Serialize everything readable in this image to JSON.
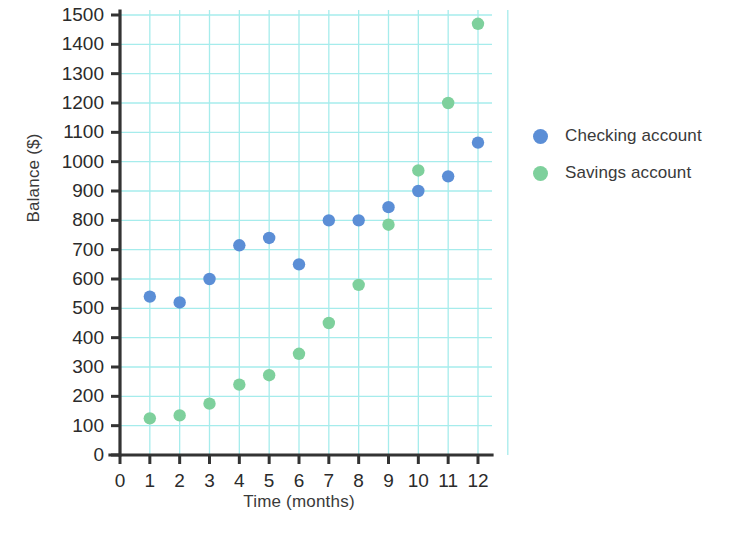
{
  "chart_data": {
    "type": "scatter",
    "title": "",
    "xlabel": "Time (months)",
    "ylabel": "Balance ($)",
    "xlim": [
      0,
      12
    ],
    "ylim": [
      0,
      1500
    ],
    "xticks": [
      0,
      1,
      2,
      3,
      4,
      5,
      6,
      7,
      8,
      9,
      10,
      11,
      12
    ],
    "yticks": [
      0,
      100,
      200,
      300,
      400,
      500,
      600,
      700,
      800,
      900,
      1000,
      1100,
      1200,
      1300,
      1400,
      1500
    ],
    "xtick_labels": [
      "0",
      "1",
      "2",
      "3",
      "4",
      "5",
      "6",
      "7",
      "8",
      "9",
      "10",
      "11",
      "12"
    ],
    "ytick_labels": [
      "0",
      "100",
      "200",
      "300",
      "400",
      "500",
      "600",
      "700",
      "800",
      "900",
      "1000",
      "1100",
      "1200",
      "1300",
      "1400",
      "1500"
    ],
    "grid": true,
    "grid_color": "#a6ecec",
    "legend_position": "right",
    "x": [
      1,
      2,
      3,
      4,
      5,
      6,
      7,
      8,
      9,
      10,
      11,
      12
    ],
    "series": [
      {
        "name": "Checking account",
        "color": "#5b8ed6",
        "values": [
          540,
          520,
          600,
          715,
          740,
          650,
          800,
          800,
          845,
          900,
          950,
          1065
        ]
      },
      {
        "name": "Savings account",
        "color": "#7ed09c",
        "values": [
          125,
          135,
          175,
          240,
          272,
          345,
          450,
          580,
          785,
          970,
          1200,
          1470
        ]
      }
    ]
  },
  "axes": {
    "y_title": "Balance ($)",
    "x_title": "Time (months)",
    "axis_color": "#333333"
  },
  "legend": {
    "items": [
      {
        "label": "Checking account",
        "marker": "circle-marker-blue",
        "color": "#5b8ed6"
      },
      {
        "label": "Savings account",
        "marker": "circle-marker-green",
        "color": "#7ed09c"
      }
    ]
  }
}
